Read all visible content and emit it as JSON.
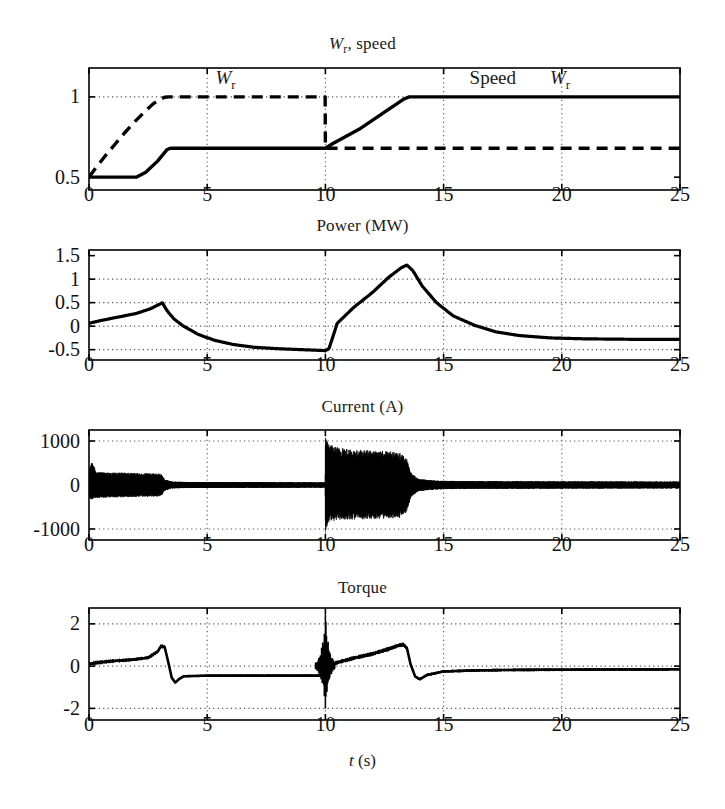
{
  "figure": {
    "xlabel": "t (s)",
    "xlabel_italic_part": "t",
    "xlabel_rest": " (s)",
    "background": "#ffffff",
    "line_color": "#000000",
    "grid_color": "#555555"
  },
  "panels": [
    {
      "id": "speed",
      "title": "W_r, speed",
      "title_parts": {
        "italic": "W",
        "sub": "r",
        "rest": ", speed"
      },
      "ylabel": "",
      "yticks": [
        0.5,
        1
      ],
      "ytick_labels": [
        "0.5",
        "1"
      ],
      "ylim": [
        0.42,
        1.18
      ],
      "xticks": [
        0,
        5,
        10,
        15,
        20,
        25
      ],
      "xtick_labels": [
        "0",
        "5",
        "10",
        "15",
        "20",
        "25"
      ],
      "xlim": [
        0,
        25
      ],
      "gridlines_y": [
        1
      ],
      "gridlines_x": [
        5,
        10,
        15,
        20
      ],
      "annotations": [
        {
          "text": "W_r",
          "italic": "W",
          "sub": "r",
          "x": 5.35,
          "y": 1.105
        },
        {
          "text": "Speed",
          "x": 16.1,
          "y": 1.105
        },
        {
          "text": "W_r",
          "italic": "W",
          "sub": "r",
          "x": 19.5,
          "y": 1.105
        }
      ]
    },
    {
      "id": "power",
      "title": "Power (MW)",
      "yticks": [
        -0.5,
        0,
        0.5,
        1,
        1.5
      ],
      "ytick_labels": [
        "-0.5",
        "0",
        "0.5",
        "1",
        "1.5"
      ],
      "ylim": [
        -0.72,
        1.62
      ],
      "xticks": [
        0,
        5,
        10,
        15,
        20,
        25
      ],
      "xtick_labels": [
        "0",
        "5",
        "10",
        "15",
        "20",
        "25"
      ],
      "xlim": [
        0,
        25
      ],
      "gridlines_y": [
        -0.5,
        0,
        0.5,
        1
      ],
      "gridlines_x": [
        5,
        10,
        15,
        20
      ],
      "annotations": []
    },
    {
      "id": "current",
      "title": "Current (A)",
      "yticks": [
        -1000,
        0,
        1000
      ],
      "ytick_labels": [
        "-1000",
        "0",
        "1000"
      ],
      "ylim": [
        -1250,
        1250
      ],
      "xticks": [
        0,
        5,
        10,
        15,
        20,
        25
      ],
      "xtick_labels": [
        "0",
        "5",
        "10",
        "15",
        "20",
        "25"
      ],
      "xlim": [
        0,
        25
      ],
      "gridlines_y": [
        -1000,
        1000
      ],
      "gridlines_x": [
        5,
        10,
        15,
        20
      ],
      "annotations": []
    },
    {
      "id": "torque",
      "title": "Torque",
      "yticks": [
        -2,
        0,
        2
      ],
      "ytick_labels": [
        "-2",
        "0",
        "2"
      ],
      "ylim": [
        -2.55,
        2.75
      ],
      "xticks": [
        0,
        5,
        10,
        15,
        20,
        25
      ],
      "xtick_labels": [
        "0",
        "5",
        "10",
        "15",
        "20",
        "25"
      ],
      "xlim": [
        0,
        25
      ],
      "gridlines_y": [
        -2,
        0,
        2
      ],
      "gridlines_x": [
        5,
        10,
        15,
        20
      ],
      "annotations": []
    }
  ],
  "chart_data": [
    {
      "type": "line",
      "panel": "speed",
      "title": "W_r, speed",
      "xlabel": "",
      "ylabel": "",
      "xlim": [
        0,
        25
      ],
      "ylim": [
        0.42,
        1.18
      ],
      "grid": true,
      "legend": [
        "W_r (reference, dashed)",
        "Speed (actual, solid)"
      ],
      "series": [
        {
          "name": "W_r reference",
          "style": "dashed",
          "x": [
            0,
            0.3,
            0.7,
            1.1,
            1.5,
            1.9,
            2.3,
            2.7,
            3.0,
            3.2,
            3.35,
            4,
            6,
            8,
            9.99,
            10.0,
            10.01,
            25
          ],
          "y": [
            0.5,
            0.56,
            0.635,
            0.705,
            0.775,
            0.84,
            0.9,
            0.955,
            0.985,
            0.998,
            1.0,
            1.0,
            1.0,
            1.0,
            1.0,
            0.68,
            0.68,
            0.68
          ]
        },
        {
          "name": "Speed actual",
          "style": "solid",
          "x": [
            0,
            2.0,
            2.4,
            2.9,
            3.3,
            3.45,
            5,
            8,
            10.0,
            10.3,
            11.5,
            12.5,
            13.3,
            13.55,
            14.5,
            20,
            25
          ],
          "y": [
            0.5,
            0.5,
            0.53,
            0.6,
            0.672,
            0.68,
            0.68,
            0.68,
            0.68,
            0.708,
            0.805,
            0.905,
            0.985,
            1.0,
            1.0,
            1.0,
            1.0
          ]
        }
      ]
    },
    {
      "type": "line",
      "panel": "power",
      "title": "Power (MW)",
      "xlabel": "",
      "ylabel": "Power (MW)",
      "xlim": [
        0,
        25
      ],
      "ylim": [
        -0.72,
        1.62
      ],
      "grid": true,
      "series": [
        {
          "name": "Power",
          "style": "solid",
          "x": [
            0,
            0.5,
            1.2,
            2.0,
            2.6,
            3.0,
            3.1,
            3.3,
            3.6,
            4.0,
            4.6,
            5.3,
            6.1,
            7.0,
            8.0,
            9.0,
            10.0,
            10.15,
            10.5,
            11.2,
            12.0,
            12.7,
            13.2,
            13.45,
            13.7,
            14.1,
            14.7,
            15.4,
            16.3,
            17.2,
            18.2,
            19.5,
            21.0,
            23.0,
            25.0
          ],
          "y": [
            0.06,
            0.12,
            0.19,
            0.27,
            0.37,
            0.47,
            0.5,
            0.33,
            0.15,
            0.0,
            -0.17,
            -0.3,
            -0.39,
            -0.45,
            -0.48,
            -0.5,
            -0.52,
            -0.48,
            0.06,
            0.4,
            0.72,
            1.05,
            1.24,
            1.3,
            1.18,
            0.85,
            0.5,
            0.22,
            0.02,
            -0.12,
            -0.2,
            -0.25,
            -0.27,
            -0.28,
            -0.28
          ]
        }
      ]
    },
    {
      "type": "line",
      "panel": "current",
      "title": "Current (A)",
      "xlabel": "",
      "ylabel": "Current (A)",
      "xlim": [
        0,
        25
      ],
      "ylim": [
        -1250,
        1250
      ],
      "grid": true,
      "note": "High-frequency oscillating waveform; envelope described below.",
      "series": [
        {
          "name": "Current envelope (upper)",
          "style": "envelope",
          "x": [
            0,
            0.12,
            0.3,
            0.8,
            1.6,
            2.4,
            3.05,
            3.2,
            3.5,
            4.2,
            5.5,
            7.0,
            8.5,
            9.8,
            9.99,
            10.0,
            10.12,
            10.4,
            11.0,
            11.8,
            12.6,
            13.2,
            13.45,
            13.6,
            13.9,
            14.3,
            15.0,
            16.5,
            18.0,
            20.0,
            22.0,
            25.0
          ],
          "y": [
            300,
            560,
            300,
            290,
            280,
            270,
            260,
            130,
            80,
            70,
            68,
            66,
            64,
            62,
            62,
            1100,
            950,
            870,
            810,
            790,
            770,
            740,
            600,
            300,
            150,
            120,
            95,
            90,
            88,
            86,
            84,
            80
          ]
        },
        {
          "name": "Current envelope (lower)",
          "style": "envelope",
          "x": [
            0,
            0.12,
            0.3,
            0.8,
            1.6,
            2.4,
            3.05,
            3.2,
            3.5,
            4.2,
            5.5,
            7.0,
            8.5,
            9.8,
            9.99,
            10.0,
            10.12,
            10.4,
            11.0,
            11.8,
            12.6,
            13.2,
            13.45,
            13.6,
            13.9,
            14.3,
            15.0,
            16.5,
            18.0,
            20.0,
            22.0,
            25.0
          ],
          "y": [
            -300,
            -330,
            -300,
            -290,
            -280,
            -270,
            -260,
            -130,
            -80,
            -70,
            -68,
            -66,
            -64,
            -62,
            -62,
            -1100,
            -880,
            -810,
            -790,
            -780,
            -770,
            -745,
            -600,
            -300,
            -150,
            -120,
            -95,
            -90,
            -88,
            -86,
            -84,
            -80
          ]
        }
      ]
    },
    {
      "type": "line",
      "panel": "torque",
      "title": "Torque",
      "xlabel": "t (s)",
      "ylabel": "Torque",
      "xlim": [
        0,
        25
      ],
      "ylim": [
        -2.55,
        2.75
      ],
      "grid": true,
      "series": [
        {
          "name": "Torque (mean)",
          "style": "solid",
          "x": [
            0,
            0.4,
            1.0,
            1.8,
            2.5,
            2.9,
            3.05,
            3.2,
            3.35,
            3.5,
            3.65,
            3.8,
            4.0,
            5.0,
            7.0,
            9.0,
            9.9,
            10.0,
            10.1,
            10.3,
            10.6,
            11.2,
            12.0,
            12.7,
            13.1,
            13.3,
            13.45,
            13.6,
            13.8,
            14.0,
            14.3,
            15.0,
            16.5,
            18.0,
            20.0,
            22.5,
            25.0
          ],
          "y": [
            0.1,
            0.17,
            0.24,
            0.3,
            0.4,
            0.68,
            0.95,
            0.9,
            0.2,
            -0.55,
            -0.78,
            -0.62,
            -0.48,
            -0.45,
            -0.45,
            -0.45,
            -0.45,
            0.0,
            0.6,
            0.1,
            0.2,
            0.38,
            0.58,
            0.82,
            0.98,
            1.02,
            0.85,
            0.1,
            -0.5,
            -0.62,
            -0.42,
            -0.25,
            -0.2,
            -0.18,
            -0.17,
            -0.16,
            -0.15
          ]
        },
        {
          "name": "Torque spike at t=10",
          "style": "spike",
          "x": [
            10.0
          ],
          "y_min": -2.0,
          "y_max": 2.45
        }
      ]
    }
  ]
}
